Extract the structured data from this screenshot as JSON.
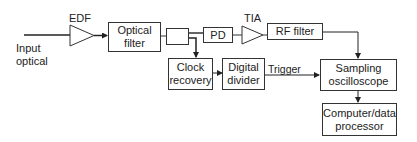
{
  "diagram": {
    "type": "block-diagram",
    "input_label_line1": "Input",
    "input_label_line2": "optical",
    "amplifiers": {
      "edf": "EDF",
      "tia": "TIA"
    },
    "blocks": {
      "optical_filter_line1": "Optical",
      "optical_filter_line2": "filter",
      "pd": "PD",
      "rf_filter": "RF filter",
      "clock_recovery_line1": "Clock",
      "clock_recovery_line2": "recovery",
      "digital_divider_line1": "Digital",
      "digital_divider_line2": "divider",
      "sampling_oscilloscope_line1": "Sampling",
      "sampling_oscilloscope_line2": "oscilloscope",
      "computer_line1": "Computer/data",
      "computer_line2": "processor"
    },
    "edge_labels": {
      "trigger": "Trigger"
    },
    "colors": {
      "stroke": "#333333",
      "background": "#ffffff"
    }
  }
}
